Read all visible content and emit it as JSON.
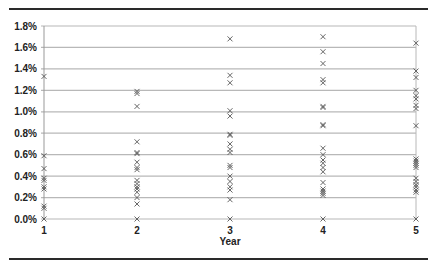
{
  "chart_data": {
    "type": "scatter",
    "title": "",
    "xlabel": "Year",
    "ylabel": "",
    "xlim": [
      1,
      5
    ],
    "ylim": [
      0,
      1.8
    ],
    "x_ticks": [
      "1",
      "2",
      "3",
      "4",
      "5"
    ],
    "y_ticks": [
      "0.0%",
      "0.2%",
      "0.4%",
      "0.6%",
      "0.8%",
      "1.0%",
      "1.2%",
      "1.4%",
      "1.6%",
      "1.8%"
    ],
    "grid": true,
    "legend": null,
    "marker": "x",
    "series": [
      {
        "x": 1,
        "values": [
          1.33,
          0.59,
          0.47,
          0.38,
          0.36,
          0.3,
          0.28,
          0.12,
          0.1,
          0.0
        ]
      },
      {
        "x": 2,
        "values": [
          1.19,
          1.17,
          1.05,
          0.72,
          0.62,
          0.61,
          0.53,
          0.48,
          0.46,
          0.36,
          0.33,
          0.3,
          0.28,
          0.25,
          0.2,
          0.14,
          0.0
        ]
      },
      {
        "x": 3,
        "values": [
          1.68,
          1.34,
          1.27,
          1.01,
          0.96,
          0.79,
          0.78,
          0.7,
          0.65,
          0.62,
          0.5,
          0.48,
          0.4,
          0.35,
          0.3,
          0.27,
          0.18,
          0.0
        ]
      },
      {
        "x": 4,
        "values": [
          1.7,
          1.56,
          1.45,
          1.3,
          1.27,
          1.05,
          1.04,
          0.88,
          0.87,
          0.66,
          0.6,
          0.55,
          0.52,
          0.48,
          0.44,
          0.34,
          0.28,
          0.26,
          0.24,
          0.22,
          0.0
        ]
      },
      {
        "x": 5,
        "values": [
          1.64,
          1.38,
          1.32,
          1.2,
          1.15,
          1.12,
          1.06,
          1.03,
          0.87,
          0.56,
          0.54,
          0.52,
          0.5,
          0.48,
          0.38,
          0.35,
          0.32,
          0.3,
          0.27,
          0.25,
          0.0
        ]
      }
    ],
    "colors": {
      "marker": "#555555",
      "grid": "#b8b8b8",
      "axis": "#999999",
      "text": "#222222"
    }
  }
}
